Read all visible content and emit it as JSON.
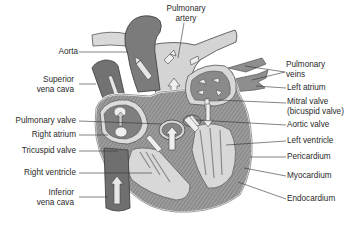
{
  "diagram": {
    "colors": {
      "deoxygenated": "#6f6f6f",
      "oxygenated_vessel": "#d6d6d6",
      "chamber_fill": "#8a8a8a",
      "muscle": "#9a9a9a",
      "pericardium_line": "#ffffff",
      "label_text": "#2a2a2a",
      "leader_line": "#333333"
    },
    "labels_left": [
      {
        "id": "aorta",
        "lines": [
          "Aorta"
        ]
      },
      {
        "id": "superior-vena-cava",
        "lines": [
          "Superior",
          "vena cava"
        ]
      },
      {
        "id": "pulmonary-valve",
        "lines": [
          "Pulmonary valve"
        ]
      },
      {
        "id": "right-atrium",
        "lines": [
          "Right atrium"
        ]
      },
      {
        "id": "tricuspid-valve",
        "lines": [
          "Tricuspid valve"
        ]
      },
      {
        "id": "right-ventricle",
        "lines": [
          "Right ventricle"
        ]
      },
      {
        "id": "inferior-vena-cava",
        "lines": [
          "Inferior",
          "vena cava"
        ]
      }
    ],
    "labels_top": [
      {
        "id": "pulmonary-artery",
        "lines": [
          "Pulmonary",
          "artery"
        ]
      }
    ],
    "labels_right": [
      {
        "id": "pulmonary-veins",
        "lines": [
          "Pulmonary",
          "veins"
        ]
      },
      {
        "id": "left-atrium",
        "lines": [
          "Left atrium"
        ]
      },
      {
        "id": "mitral-valve",
        "lines": [
          "Mitral valve",
          "(bicuspid valve)"
        ]
      },
      {
        "id": "aortic-valve",
        "lines": [
          "Aortic valve"
        ]
      },
      {
        "id": "left-ventricle",
        "lines": [
          "Left ventricle"
        ]
      },
      {
        "id": "pericardium",
        "lines": [
          "Pericardium"
        ]
      },
      {
        "id": "myocardium",
        "lines": [
          "Myocardium"
        ]
      },
      {
        "id": "endocardium",
        "lines": [
          "Endocardium"
        ]
      }
    ]
  }
}
